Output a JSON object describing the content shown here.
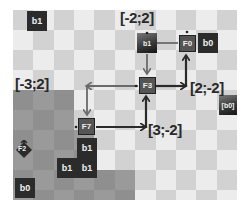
{
  "board": {
    "columns": 11,
    "rows": 10,
    "colors": {
      "light": "#ececec",
      "dark": "#d2d2d2",
      "shade": "#8f8f8f",
      "tile": "#2b2b2b",
      "arrow": "#333333"
    }
  },
  "tiles": [
    {
      "id": "tile-b1-top",
      "label": "b1"
    },
    {
      "id": "tile-b1-src",
      "label": "b1"
    },
    {
      "id": "tile-b0-right",
      "label": "b0"
    },
    {
      "id": "tile-b0-edge",
      "label": "[b0]"
    },
    {
      "id": "tile-b1-stack-a",
      "label": "b1"
    },
    {
      "id": "tile-b1-stack-b",
      "label": "b1"
    },
    {
      "id": "tile-b1-stack-c",
      "label": "b1"
    },
    {
      "id": "tile-b0-bottom",
      "label": "b0"
    }
  ],
  "nodes": {
    "f0": "F0",
    "f3": "F3",
    "f7": "F7",
    "f2": "F2"
  },
  "labels": {
    "top": "[-2;2]",
    "left": "[-3;2]",
    "right": "[2;-2]",
    "bottom": "[3;-2]"
  }
}
